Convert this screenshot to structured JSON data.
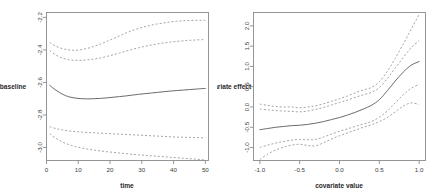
{
  "figure": {
    "background": "#ffffff",
    "panel_count": 2,
    "estimate_color": "#6b6b6b",
    "band_color": "#9a9a9a",
    "axis_color": "#8a8a8a"
  },
  "chart_data": [
    {
      "type": "line",
      "panel": "left",
      "title": "",
      "xlabel": "time",
      "ylabel": "baseline",
      "xlim": [
        0,
        51
      ],
      "ylim": [
        -3.08,
        -2.17
      ],
      "grid": false,
      "legend": "none",
      "xticks": [
        0,
        10,
        20,
        30,
        40,
        50
      ],
      "xticklabels": [
        "0",
        "10",
        "20",
        "30",
        "40",
        "50"
      ],
      "yticks": [
        -2.2,
        -2.4,
        -2.6,
        -2.8,
        -3.0
      ],
      "yticklabels": [
        "-2.2",
        "-2.4",
        "-2.6",
        "-2.8",
        "-3.0"
      ],
      "x": [
        1,
        3,
        5,
        7,
        9,
        11,
        13,
        15,
        17,
        19,
        21,
        23,
        25,
        27,
        29,
        31,
        33,
        35,
        37,
        39,
        41,
        43,
        45,
        47,
        49,
        50
      ],
      "series": [
        {
          "name": "upper simultaneous band",
          "style": "dashed",
          "values": [
            -2.355,
            -2.378,
            -2.392,
            -2.4,
            -2.402,
            -2.398,
            -2.39,
            -2.378,
            -2.364,
            -2.348,
            -2.331,
            -2.313,
            -2.296,
            -2.281,
            -2.268,
            -2.257,
            -2.248,
            -2.24,
            -2.234,
            -2.228,
            -2.224,
            -2.221,
            -2.219,
            -2.218,
            -2.218,
            -2.219
          ]
        },
        {
          "name": "upper pointwise band",
          "style": "dashed",
          "values": [
            -2.405,
            -2.432,
            -2.45,
            -2.46,
            -2.464,
            -2.464,
            -2.461,
            -2.456,
            -2.449,
            -2.44,
            -2.43,
            -2.419,
            -2.408,
            -2.397,
            -2.387,
            -2.378,
            -2.37,
            -2.363,
            -2.357,
            -2.352,
            -2.348,
            -2.344,
            -2.341,
            -2.339,
            -2.337,
            -2.337
          ]
        },
        {
          "name": "estimate",
          "style": "solid",
          "values": [
            -2.618,
            -2.648,
            -2.672,
            -2.688,
            -2.696,
            -2.7,
            -2.701,
            -2.7,
            -2.698,
            -2.695,
            -2.691,
            -2.687,
            -2.683,
            -2.678,
            -2.673,
            -2.669,
            -2.665,
            -2.661,
            -2.657,
            -2.653,
            -2.65,
            -2.647,
            -2.644,
            -2.641,
            -2.638,
            -2.637
          ]
        },
        {
          "name": "lower pointwise band",
          "style": "dashed",
          "values": [
            -2.872,
            -2.884,
            -2.892,
            -2.898,
            -2.902,
            -2.905,
            -2.908,
            -2.91,
            -2.912,
            -2.914,
            -2.916,
            -2.918,
            -2.92,
            -2.922,
            -2.924,
            -2.926,
            -2.928,
            -2.93,
            -2.932,
            -2.934,
            -2.936,
            -2.937,
            -2.938,
            -2.939,
            -2.94,
            -2.94
          ]
        },
        {
          "name": "lower simultaneous band",
          "style": "dashed",
          "values": [
            -2.916,
            -2.944,
            -2.966,
            -2.982,
            -2.994,
            -3.003,
            -3.01,
            -3.016,
            -3.021,
            -3.026,
            -3.03,
            -3.034,
            -3.038,
            -3.042,
            -3.045,
            -3.048,
            -3.051,
            -3.054,
            -3.057,
            -3.06,
            -3.063,
            -3.066,
            -3.069,
            -3.072,
            -3.075,
            -3.077
          ]
        }
      ]
    },
    {
      "type": "line",
      "panel": "right",
      "title": "",
      "xlabel": "covariate value",
      "ylabel": "covariate effect",
      "xlim": [
        -1.08,
        1.08
      ],
      "ylim": [
        -1.32,
        2.33
      ],
      "grid": false,
      "legend": "none",
      "xticks": [
        -1.0,
        -0.5,
        0.0,
        0.5,
        1.0
      ],
      "xticklabels": [
        "-1.0",
        "-0.5",
        "0.0",
        "0.5",
        "1.0"
      ],
      "yticks": [
        2.0,
        1.5,
        1.0,
        0.5,
        0.0,
        -0.5,
        -1.0
      ],
      "yticklabels": [
        "2.0",
        "1.5",
        "1.0",
        "0.5",
        "0.0",
        "-0.5",
        "-1.0"
      ],
      "x": [
        -1.0,
        -0.9,
        -0.8,
        -0.7,
        -0.6,
        -0.5,
        -0.4,
        -0.3,
        -0.2,
        -0.1,
        0.0,
        0.1,
        0.2,
        0.3,
        0.4,
        0.5,
        0.6,
        0.7,
        0.8,
        0.9,
        1.0
      ],
      "series": [
        {
          "name": "upper simultaneous band",
          "style": "dashed",
          "values": [
            0.07,
            0.04,
            0.01,
            0.0,
            0.0,
            -0.02,
            0.0,
            0.03,
            0.08,
            0.14,
            0.2,
            0.27,
            0.35,
            0.42,
            0.48,
            0.62,
            0.88,
            1.2,
            1.55,
            1.92,
            2.28
          ]
        },
        {
          "name": "upper pointwise band",
          "style": "dashed",
          "values": [
            -0.05,
            -0.07,
            -0.09,
            -0.1,
            -0.11,
            -0.12,
            -0.1,
            -0.06,
            -0.01,
            0.05,
            0.11,
            0.17,
            0.24,
            0.3,
            0.36,
            0.48,
            0.7,
            0.96,
            1.22,
            1.46,
            1.64
          ]
        },
        {
          "name": "estimate",
          "style": "solid",
          "values": [
            -0.56,
            -0.53,
            -0.5,
            -0.48,
            -0.46,
            -0.45,
            -0.43,
            -0.4,
            -0.36,
            -0.31,
            -0.26,
            -0.2,
            -0.13,
            -0.05,
            0.04,
            0.18,
            0.4,
            0.64,
            0.86,
            1.03,
            1.12
          ]
        },
        {
          "name": "lower pointwise band",
          "style": "dashed",
          "values": [
            -1.0,
            -0.94,
            -0.89,
            -0.85,
            -0.82,
            -0.8,
            -0.81,
            -0.8,
            -0.74,
            -0.67,
            -0.6,
            -0.54,
            -0.48,
            -0.42,
            -0.36,
            -0.25,
            -0.1,
            0.1,
            0.3,
            0.46,
            0.56
          ]
        },
        {
          "name": "lower simultaneous band",
          "style": "dashed",
          "values": [
            -1.29,
            -1.16,
            -1.06,
            -0.99,
            -0.94,
            -0.92,
            -0.95,
            -0.96,
            -0.88,
            -0.79,
            -0.71,
            -0.64,
            -0.57,
            -0.5,
            -0.44,
            -0.36,
            -0.26,
            -0.12,
            0.02,
            0.1,
            0.06
          ]
        }
      ]
    }
  ]
}
